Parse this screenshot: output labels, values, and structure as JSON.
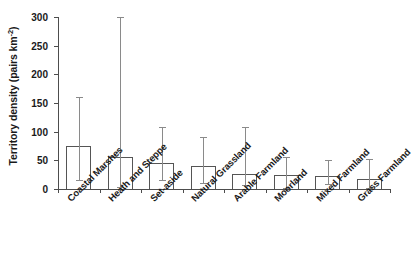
{
  "chart_data": {
    "type": "bar",
    "title": "",
    "xlabel": "",
    "ylabel": "Territory density (pairs km-2)",
    "ylabel_prefix": "Territory density (pairs km",
    "ylabel_exponent": "-2",
    "ylabel_suffix": ")",
    "ylim": [
      0,
      300
    ],
    "yticks": [
      0,
      50,
      100,
      150,
      200,
      250,
      300
    ],
    "ytick_labels": [
      "0",
      "50",
      "100",
      "150",
      "200",
      "250",
      "300"
    ],
    "grid": false,
    "legend": "none",
    "error_bar_style": "asymmetric range (min-max)",
    "categories": [
      "Coastal Marshes",
      "Heath and Steppe",
      "Set-aside",
      "Natural Grassland",
      "Arable Farmland",
      "Moorland",
      "Mixed Farmland",
      "Grass Farmland"
    ],
    "values": [
      75,
      56,
      46,
      40,
      27,
      25,
      22,
      18
    ],
    "err_low": [
      15,
      4,
      15,
      11,
      7,
      1,
      8,
      2
    ],
    "err_high": [
      160,
      300,
      108,
      90,
      109,
      55,
      50,
      52
    ],
    "series": [
      {
        "name": "Territory density",
        "values": [
          75,
          56,
          46,
          40,
          27,
          25,
          22,
          18
        ]
      }
    ],
    "points": [
      {
        "category": "Coastal Marshes",
        "value": 75,
        "low": 15,
        "high": 160
      },
      {
        "category": "Heath and Steppe",
        "value": 56,
        "low": 4,
        "high": 300
      },
      {
        "category": "Set-aside",
        "value": 46,
        "low": 15,
        "high": 108
      },
      {
        "category": "Natural Grassland",
        "value": 40,
        "low": 11,
        "high": 90
      },
      {
        "category": "Arable Farmland",
        "value": 27,
        "low": 7,
        "high": 109
      },
      {
        "category": "Moorland",
        "value": 25,
        "low": 1,
        "high": 55
      },
      {
        "category": "Mixed Farmland",
        "value": 22,
        "low": 8,
        "high": 50
      },
      {
        "category": "Grass Farmland",
        "value": 18,
        "low": 2,
        "high": 52
      }
    ],
    "colors": {
      "bar_edge": "#555555",
      "bar_fill": "none",
      "axis": "#4d4d4d",
      "error_bar": "#8a8a8a",
      "text": "#1a1a1a",
      "background": "#ffffff"
    }
  }
}
